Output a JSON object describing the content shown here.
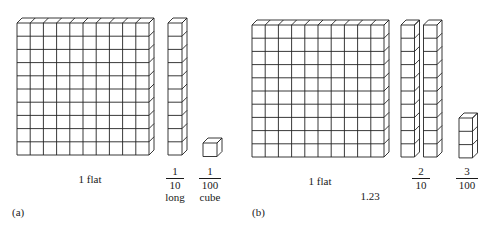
{
  "panel_a": {
    "label": "(a)",
    "flat": {
      "caption": "1 flat",
      "rows": 10,
      "cols": 10
    },
    "long": {
      "numerator": "1",
      "denominator": "10",
      "caption": "long",
      "cells": 10
    },
    "cube": {
      "numerator": "1",
      "denominator": "100",
      "caption": "cube",
      "cells": 1
    }
  },
  "panel_b": {
    "label": "(b)",
    "flat": {
      "caption": "1 flat",
      "rows": 10,
      "cols": 10
    },
    "longs": {
      "numerator": "2",
      "denominator": "10",
      "count": 2,
      "cells": 10
    },
    "cubes": {
      "numerator": "3",
      "denominator": "100",
      "count": 3
    },
    "total": "1.23"
  },
  "colors": {
    "line": "#222222",
    "background": "#ffffff"
  }
}
